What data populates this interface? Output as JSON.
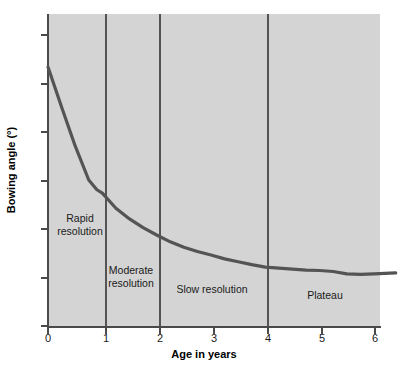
{
  "chart_data": {
    "type": "line",
    "title": "",
    "xlabel": "Age in years",
    "ylabel": "Bowing angle (°)",
    "xlim": [
      0,
      6.4
    ],
    "ylim": [
      0,
      64
    ],
    "xticks": [
      0,
      1,
      2,
      3,
      4,
      5,
      6
    ],
    "xticklabels": [
      "0",
      "1",
      "2",
      "3",
      "4",
      "5",
      "6"
    ],
    "yticks": [
      0,
      10,
      20,
      30,
      40,
      50,
      60
    ],
    "yticklabels": [
      "0",
      "10",
      "20",
      "30",
      "40",
      "50",
      "60"
    ],
    "grid": false,
    "legend": "none",
    "plot_background": "#d4d4d4",
    "line_color": "#545454",
    "series": [
      {
        "name": "Bowing angle",
        "x": [
          0.0,
          0.25,
          0.5,
          0.75,
          0.9,
          1.0,
          1.25,
          1.5,
          1.75,
          2.0,
          2.25,
          2.5,
          2.75,
          3.0,
          3.25,
          3.5,
          3.75,
          4.0,
          4.25,
          4.5,
          4.75,
          5.0,
          5.25,
          5.5,
          5.75,
          6.0,
          6.4
        ],
        "y": [
          53.2,
          45.0,
          37.0,
          30.0,
          28.0,
          27.3,
          24.2,
          22.0,
          20.2,
          18.7,
          17.3,
          16.2,
          15.3,
          14.6,
          13.8,
          13.2,
          12.6,
          12.1,
          11.9,
          11.7,
          11.5,
          11.4,
          11.2,
          10.7,
          10.6,
          10.7,
          10.9
        ]
      }
    ],
    "region_dividers": [
      1,
      2,
      4
    ],
    "annotations": [
      {
        "text": "Rapid\nresolution",
        "x": 0.59,
        "y": 21.5,
        "name": "rapid-resolution"
      },
      {
        "text": "Moderate\nresolution",
        "x": 1.52,
        "y": 10.8,
        "name": "moderate-resolution"
      },
      {
        "text": "Slow resolution",
        "x": 2.98,
        "y": 7.0,
        "name": "slow-resolution"
      },
      {
        "text": "Plateau",
        "x": 5.12,
        "y": 5.8,
        "name": "plateau"
      }
    ]
  }
}
